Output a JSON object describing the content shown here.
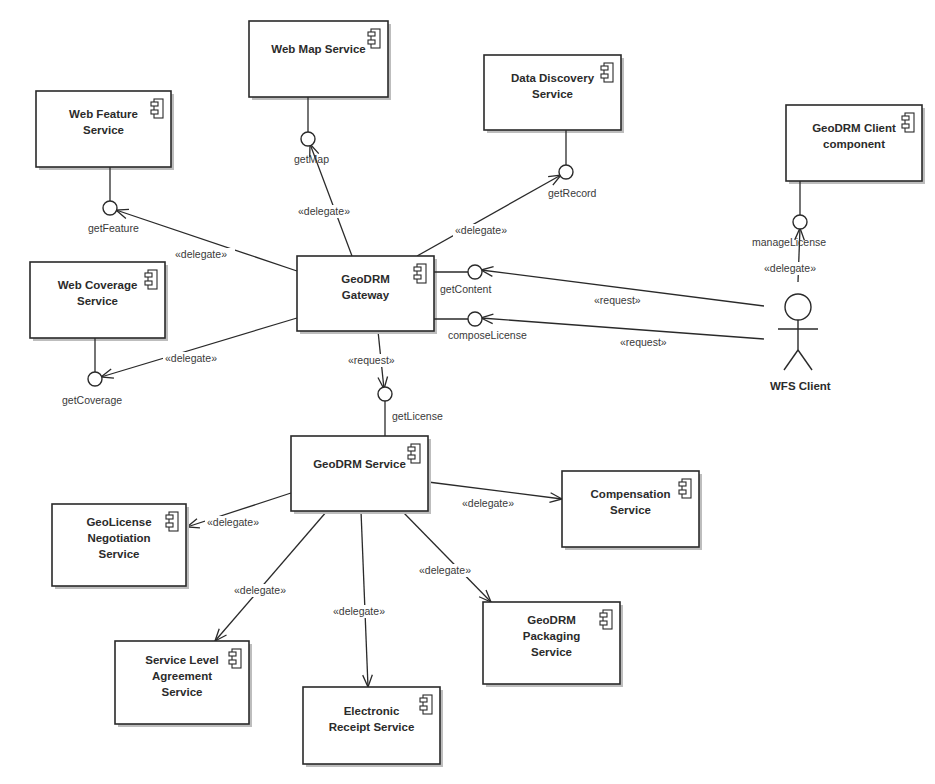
{
  "diagram": {
    "type": "UML component diagram",
    "components": [
      {
        "id": "wms",
        "lines": [
          "Web Map Service"
        ],
        "x": 249,
        "y": 21,
        "w": 139,
        "h": 76
      },
      {
        "id": "dds",
        "lines": [
          "Data Discovery",
          "Service"
        ],
        "x": 484,
        "y": 55,
        "w": 137,
        "h": 75
      },
      {
        "id": "wfs",
        "lines": [
          "Web Feature",
          "Service"
        ],
        "x": 36,
        "y": 91,
        "w": 135,
        "h": 76
      },
      {
        "id": "client",
        "lines": [
          "GeoDRM Client",
          "component"
        ],
        "x": 786,
        "y": 105,
        "w": 136,
        "h": 76
      },
      {
        "id": "wcs",
        "lines": [
          "Web Coverage",
          "Service"
        ],
        "x": 30,
        "y": 262,
        "w": 135,
        "h": 76
      },
      {
        "id": "gateway",
        "lines": [
          "GeoDRM",
          "Gateway"
        ],
        "x": 297,
        "y": 256,
        "w": 137,
        "h": 75
      },
      {
        "id": "service",
        "lines": [
          "GeoDRM Service"
        ],
        "x": 291,
        "y": 436,
        "w": 137,
        "h": 75
      },
      {
        "id": "comp",
        "lines": [
          "Compensation",
          "Service"
        ],
        "x": 562,
        "y": 471,
        "w": 137,
        "h": 76
      },
      {
        "id": "nego",
        "lines": [
          "GeoLicense",
          "Negotiation",
          "Service"
        ],
        "x": 52,
        "y": 504,
        "w": 134,
        "h": 82
      },
      {
        "id": "pack",
        "lines": [
          "GeoDRM",
          "Packaging",
          "Service"
        ],
        "x": 483,
        "y": 602,
        "w": 137,
        "h": 82
      },
      {
        "id": "sla",
        "lines": [
          "Service Level",
          "Agreement",
          "Service"
        ],
        "x": 115,
        "y": 641,
        "w": 134,
        "h": 83
      },
      {
        "id": "receipt",
        "lines": [
          "Electronic",
          "Receipt Service"
        ],
        "x": 303,
        "y": 687,
        "w": 137,
        "h": 77
      }
    ],
    "interfaces": [
      {
        "id": "getMap",
        "label": "getMap",
        "cx": 308,
        "cy": 139,
        "from": [
          308,
          97
        ],
        "lx": 294,
        "ly": 163
      },
      {
        "id": "getRecord",
        "label": "getRecord",
        "cx": 566,
        "cy": 172,
        "from": [
          566,
          130
        ],
        "lx": 548,
        "ly": 197
      },
      {
        "id": "getFeature",
        "label": "getFeature",
        "cx": 110,
        "cy": 208,
        "from": [
          110,
          167
        ],
        "lx": 88,
        "ly": 232
      },
      {
        "id": "manageLicense",
        "label": "manageLicense",
        "cx": 800,
        "cy": 222,
        "from": [
          800,
          181
        ],
        "lx": 752,
        "ly": 246
      },
      {
        "id": "getContent",
        "label": "getContent",
        "cx": 475,
        "cy": 272,
        "from": [
          434,
          272
        ],
        "lx": 440,
        "ly": 293
      },
      {
        "id": "composeLicense",
        "label": "composeLicense",
        "cx": 475,
        "cy": 319,
        "from": [
          434,
          319
        ],
        "lx": 448,
        "ly": 339
      },
      {
        "id": "getCoverage",
        "label": "getCoverage",
        "cx": 95,
        "cy": 379,
        "from": [
          95,
          338
        ],
        "lx": 62,
        "ly": 404
      },
      {
        "id": "getLicense",
        "label": "getLicense",
        "cx": 385,
        "cy": 394,
        "from": [
          385,
          436
        ],
        "lx": 392,
        "ly": 420
      }
    ],
    "edges": [
      {
        "stereotype": "«delegate»",
        "points": [
          [
            352,
            256
          ],
          [
            310,
            144
          ]
        ],
        "label_x": 298,
        "label_y": 215
      },
      {
        "stereotype": "«delegate»",
        "points": [
          [
            417,
            256
          ],
          [
            561,
            175
          ]
        ],
        "label_x": 455,
        "label_y": 234
      },
      {
        "stereotype": "«delegate»",
        "points": [
          [
            297,
            271
          ],
          [
            116,
            210
          ]
        ],
        "label_x": 175,
        "label_y": 258
      },
      {
        "stereotype": "«delegate»",
        "points": [
          [
            297,
            318
          ],
          [
            101,
            377
          ]
        ],
        "label_x": 165,
        "label_y": 362
      },
      {
        "stereotype": "«request»",
        "points": [
          [
            378,
            331
          ],
          [
            384,
            389
          ]
        ],
        "label_x": 348,
        "label_y": 364
      },
      {
        "stereotype": "«request»",
        "points": [
          [
            764,
            306
          ],
          [
            481,
            270
          ]
        ],
        "label_x": 594,
        "label_y": 304
      },
      {
        "stereotype": "«request»",
        "points": [
          [
            764,
            339
          ],
          [
            481,
            318
          ]
        ],
        "label_x": 620,
        "label_y": 346
      },
      {
        "stereotype": "«delegate»",
        "points": [
          [
            798,
            282
          ],
          [
            800,
            228
          ]
        ],
        "label_x": 764,
        "label_y": 272
      },
      {
        "stereotype": "«delegate»",
        "points": [
          [
            291,
            493
          ],
          [
            187,
            527
          ]
        ],
        "label_x": 207,
        "label_y": 526
      },
      {
        "stereotype": "«delegate»",
        "points": [
          [
            428,
            482
          ],
          [
            562,
            499
          ]
        ],
        "label_x": 462,
        "label_y": 507
      },
      {
        "stereotype": "«delegate»",
        "points": [
          [
            327,
            511
          ],
          [
            215,
            641
          ]
        ],
        "label_x": 234,
        "label_y": 594
      },
      {
        "stereotype": "«delegate»",
        "points": [
          [
            361,
            511
          ],
          [
            368,
            687
          ]
        ],
        "label_x": 333,
        "label_y": 615
      },
      {
        "stereotype": "«delegate»",
        "points": [
          [
            402,
            511
          ],
          [
            491,
            602
          ]
        ],
        "label_x": 419,
        "label_y": 574
      }
    ],
    "actor": {
      "label": "WFS Client",
      "head_cx": 798,
      "head_cy": 307,
      "head_r": 13,
      "label_x": 770,
      "label_y": 390
    }
  }
}
